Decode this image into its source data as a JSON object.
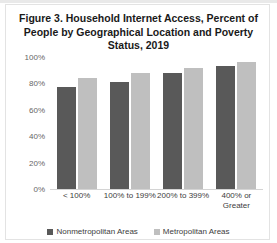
{
  "figure": {
    "title": "Figure 3. Household Internet Access, Percent of People by Geographical Location and Poverty Status, 2019"
  },
  "colors": {
    "series_nonmetro": "#595959",
    "series_metro": "#bfbfbf",
    "axis_text": "#666666",
    "label_text": "#3d3d3d"
  },
  "chart_data": {
    "type": "bar",
    "title": "Figure 3. Household Internet Access, Percent of People by Geographical Location and Poverty Status, 2019",
    "xlabel": "",
    "ylabel": "",
    "ylim": [
      0,
      100
    ],
    "yticks": [
      "0%",
      "20%",
      "40%",
      "60%",
      "80%",
      "100%"
    ],
    "ytick_values": [
      0,
      20,
      40,
      60,
      80,
      100
    ],
    "grid": false,
    "legend_position": "bottom",
    "categories": [
      "< 100%",
      "100% to 199%",
      "200% to 399%",
      "400% or Greater"
    ],
    "series": [
      {
        "name": "Nonmetropolitan Areas",
        "values": [
          77,
          81,
          88,
          93
        ]
      },
      {
        "name": "Metropolitan Areas",
        "values": [
          84,
          88,
          92,
          96
        ]
      }
    ]
  }
}
